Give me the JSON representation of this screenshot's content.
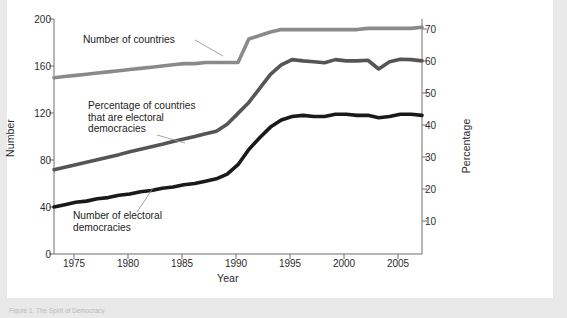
{
  "figure": {
    "background_color": "#ffffff",
    "page_background_color": "#e9e9e9",
    "caption": "Figure 1. The Spirit of Democracy"
  },
  "axes": {
    "x_title": "Year",
    "y_left_title": "Number",
    "y_right_title": "Percentage"
  },
  "annotations": {
    "countries": "Number of countries",
    "percentage": "Percentage of countries\nthat are electoral\ndemocracies",
    "democracies": "Number of electoral\ndemocracies"
  },
  "colors": {
    "line_countries": "#8a8a8a",
    "line_percentage": "#555555",
    "line_democracies": "#1a1a1a",
    "axis": "#6e6e6e",
    "text": "#1c1c1c"
  },
  "chart_data": {
    "type": "line",
    "title": "",
    "subtitle": "",
    "xlabel": "Year",
    "ylabel": "Number",
    "ylabel_right": "Percentage",
    "grid": false,
    "legend": "inline-annotations",
    "xlim": [
      1973,
      2007
    ],
    "ylim": [
      0,
      200
    ],
    "ylim_right": [
      0,
      75.2
    ],
    "xticks": [
      1975,
      1980,
      1985,
      1990,
      1995,
      2000,
      2005
    ],
    "yticks_left": [
      0,
      40,
      80,
      120,
      160,
      200
    ],
    "yticks_right": [
      10,
      20,
      30,
      40,
      50,
      60,
      70
    ],
    "x": [
      1973,
      1974,
      1975,
      1976,
      1977,
      1978,
      1979,
      1980,
      1981,
      1982,
      1983,
      1984,
      1985,
      1986,
      1987,
      1988,
      1989,
      1990,
      1991,
      1992,
      1993,
      1994,
      1995,
      1996,
      1997,
      1998,
      1999,
      2000,
      2001,
      2002,
      2003,
      2004,
      2005,
      2006,
      2007
    ],
    "series": [
      {
        "name": "Number of countries",
        "axis": "left",
        "color": "#8a8a8a",
        "values": [
          150,
          151,
          152,
          153,
          154,
          155,
          156,
          157,
          158,
          159,
          160,
          161,
          162,
          162,
          163,
          163,
          163,
          163,
          183,
          186,
          189,
          191,
          191,
          191,
          191,
          191,
          191,
          191,
          191,
          192,
          192,
          192,
          192,
          192,
          193
        ]
      },
      {
        "name": "Percentage of countries that are electoral democracies",
        "axis": "right",
        "color": "#555555",
        "values": [
          27.0,
          27.8,
          28.6,
          29.4,
          30.2,
          31.0,
          31.8,
          32.7,
          33.5,
          34.3,
          35.1,
          36.0,
          36.8,
          37.6,
          38.5,
          39.3,
          41.5,
          45.0,
          48.5,
          53.0,
          57.5,
          60.5,
          62.2,
          61.8,
          61.5,
          61.2,
          62.2,
          61.8,
          61.8,
          62.0,
          59.2,
          61.5,
          62.3,
          62.2,
          61.8
        ]
      },
      {
        "name": "Number of electoral democracies",
        "axis": "left",
        "color": "#1a1a1a",
        "values": [
          40,
          42,
          44,
          45,
          47,
          48,
          50,
          51,
          53,
          54,
          56,
          57,
          59,
          60,
          62,
          64,
          68,
          76,
          89,
          99,
          108,
          114,
          117,
          118,
          117,
          117,
          119,
          119,
          118,
          118,
          116,
          117,
          119,
          119,
          118
        ]
      }
    ]
  }
}
